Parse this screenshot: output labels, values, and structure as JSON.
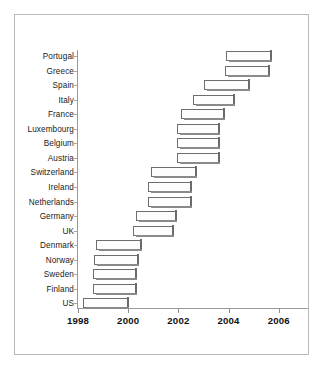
{
  "figure": {
    "frame_color": "#b9b9b9",
    "background": "#ffffff"
  },
  "axis": {
    "x_ticks": [
      "1998",
      "2000",
      "2002",
      "2004",
      "2006"
    ],
    "x_min": 1998,
    "x_max": 2006
  },
  "chart_data": {
    "type": "bar",
    "orientation": "horizontal",
    "subtype": "range-bar",
    "title": "",
    "xlabel": "",
    "ylabel": "",
    "xlim": [
      1998,
      2006
    ],
    "xticks": [
      1998,
      2000,
      2002,
      2004,
      2006
    ],
    "grid": false,
    "legend": null,
    "categories": [
      "Portugal",
      "Greece",
      "Spain",
      "Italy",
      "France",
      "Luxembourg",
      "Belgium",
      "Austria",
      "Switzerland",
      "Ireland",
      "Netherlands",
      "Germany",
      "UK",
      "Denmark",
      "Norway",
      "Sweden",
      "Finland",
      "US"
    ],
    "series": [
      {
        "name": "interval",
        "start": [
          2003.9,
          2003.85,
          2003.0,
          2002.6,
          2002.1,
          2001.95,
          2001.95,
          2001.95,
          2000.9,
          2000.8,
          2000.8,
          2000.3,
          2000.2,
          1998.7,
          1998.65,
          1998.6,
          1998.6,
          1998.2
        ],
        "end": [
          2005.7,
          2005.6,
          2004.8,
          2004.2,
          2003.8,
          2003.6,
          2003.6,
          2003.6,
          2002.7,
          2002.5,
          2002.5,
          2001.9,
          2001.8,
          2000.5,
          2000.4,
          2000.3,
          2000.3,
          2000.0
        ]
      }
    ]
  },
  "caption": ""
}
